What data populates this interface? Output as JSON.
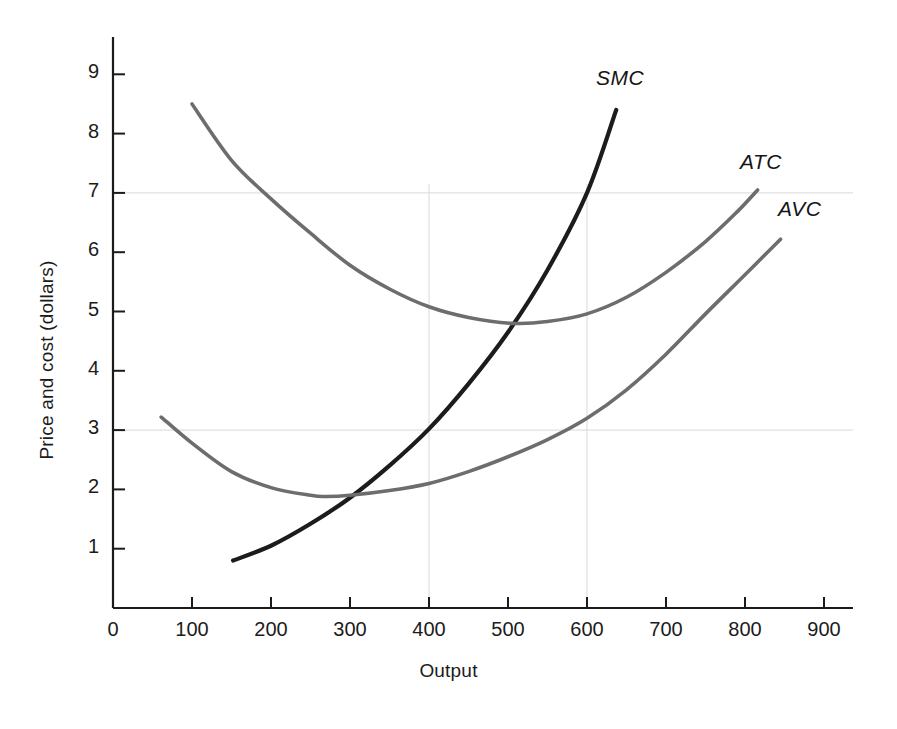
{
  "chart_data": {
    "type": "line",
    "title": "",
    "xlabel": "Output",
    "ylabel": "Price and cost (dollars)",
    "xlim": [
      0,
      950
    ],
    "ylim": [
      0,
      9.6
    ],
    "xticks": [
      0,
      100,
      200,
      300,
      400,
      500,
      600,
      700,
      800,
      900
    ],
    "xticklabels": [
      "0",
      "100",
      "200",
      "300",
      "400",
      "500",
      "600",
      "700",
      "800",
      "900"
    ],
    "yticks": [
      1,
      2,
      3,
      4,
      5,
      6,
      7,
      8,
      9
    ],
    "yticklabels": [
      "1",
      "2",
      "3",
      "4",
      "5",
      "6",
      "7",
      "8",
      "9"
    ],
    "grid": "partial",
    "gridlines": {
      "horizontal": [
        7,
        3
      ],
      "vertical": [
        400,
        600
      ]
    },
    "legend_position": "curve-end-labels",
    "colors": {
      "smc": "#1c1c1c",
      "atc": "#6d6d6d",
      "avc": "#6d6d6d",
      "axis": "#1b1b1b",
      "grid": "#d8d8d8",
      "background": "#ffffff"
    },
    "series": [
      {
        "name": "SMC",
        "label": "SMC",
        "color": "#1c1c1c",
        "points": [
          [
            152,
            0.8
          ],
          [
            200,
            1.05
          ],
          [
            250,
            1.42
          ],
          [
            300,
            1.86
          ],
          [
            350,
            2.4
          ],
          [
            400,
            3.02
          ],
          [
            450,
            3.78
          ],
          [
            500,
            4.65
          ],
          [
            550,
            5.7
          ],
          [
            600,
            7.0
          ],
          [
            637,
            8.4
          ]
        ]
      },
      {
        "name": "ATC",
        "label": "ATC",
        "color": "#6d6d6d",
        "points": [
          [
            100,
            8.5
          ],
          [
            150,
            7.55
          ],
          [
            200,
            6.9
          ],
          [
            250,
            6.32
          ],
          [
            300,
            5.78
          ],
          [
            350,
            5.38
          ],
          [
            400,
            5.08
          ],
          [
            450,
            4.9
          ],
          [
            505,
            4.8
          ],
          [
            550,
            4.83
          ],
          [
            600,
            4.96
          ],
          [
            650,
            5.24
          ],
          [
            700,
            5.66
          ],
          [
            750,
            6.18
          ],
          [
            790,
            6.68
          ],
          [
            816,
            7.05
          ]
        ]
      },
      {
        "name": "AVC",
        "label": "AVC",
        "color": "#6d6d6d",
        "points": [
          [
            61,
            3.22
          ],
          [
            100,
            2.78
          ],
          [
            150,
            2.3
          ],
          [
            200,
            2.03
          ],
          [
            250,
            1.9
          ],
          [
            270,
            1.88
          ],
          [
            300,
            1.9
          ],
          [
            350,
            1.98
          ],
          [
            400,
            2.1
          ],
          [
            450,
            2.3
          ],
          [
            500,
            2.55
          ],
          [
            550,
            2.84
          ],
          [
            600,
            3.2
          ],
          [
            650,
            3.68
          ],
          [
            700,
            4.28
          ],
          [
            750,
            4.96
          ],
          [
            800,
            5.62
          ],
          [
            845,
            6.22
          ]
        ]
      }
    ],
    "annotations": [
      {
        "text": "SMC",
        "x_px": 596,
        "y_px": 66
      },
      {
        "text": "ATC",
        "x_px": 740,
        "y_px": 150
      },
      {
        "text": "AVC",
        "x_px": 778,
        "y_px": 197
      }
    ],
    "key_intersections": [
      {
        "description": "SMC crosses AVC minimum",
        "x": 300,
        "y": 1.87
      },
      {
        "description": "SMC crosses ATC minimum",
        "x": 505,
        "y": 4.8
      },
      {
        "description": "SMC at price 7",
        "x": 600,
        "y": 7.0
      }
    ]
  }
}
